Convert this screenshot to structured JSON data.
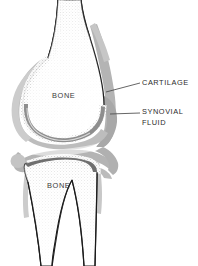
{
  "figure": {
    "kind": "anatomical-illustration",
    "background_color": "#ffffff",
    "width": 198,
    "height": 266
  },
  "palette": {
    "background": "#ffffff",
    "outline": "#1a1a1a",
    "synovial_capsule_grey": "#b0b0b0",
    "synovial_capsule_grey_light": "#c9c9c9",
    "cartilage_grey": "#9a9a9a",
    "bone_fill": "#ffffff",
    "stipple": "#8d8d8d",
    "label_text": "#2b2b2b",
    "leader_line": "#4a4a4a"
  },
  "labels": {
    "cartilage": {
      "text": "CARTILAGE",
      "leader_from_x": 106,
      "leader_from_y": 92,
      "leader_to_x": 140,
      "leader_to_y": 83
    },
    "synovial_fluid": {
      "text": "SYNOVIAL\nFLUID",
      "leader_from_x": 110,
      "leader_from_y": 114,
      "leader_to_x": 140,
      "leader_to_y": 113
    },
    "bone_femur": {
      "text": "BONE"
    },
    "bone_tibia": {
      "text": "BONE"
    }
  }
}
